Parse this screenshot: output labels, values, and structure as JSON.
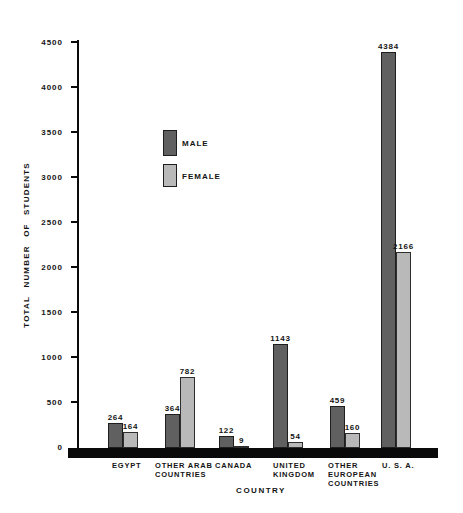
{
  "chart_data": {
    "type": "bar",
    "title": "",
    "categories": [
      "EGYPT",
      "OTHER ARAB\nCOUNTRIES",
      "CANADA",
      "UNITED\nKINGDOM",
      "OTHER\nEUROPEAN\nCOUNTRIES",
      "U. S. A."
    ],
    "series": [
      {
        "name": "MALE",
        "color": "#606060",
        "border_color": "#1e1e1e",
        "values": [
          264,
          364,
          122,
          1143,
          459,
          4384
        ]
      },
      {
        "name": "FEMALE",
        "color": "#b9b9b9",
        "border_color": "#2e2e2e",
        "values": [
          164,
          782,
          9,
          54,
          160,
          2166
        ]
      }
    ],
    "value_labels": {
      "MALE": [
        "264",
        "364",
        "122",
        "1143",
        "459",
        "4384"
      ],
      "FEMALE": [
        "164",
        "782",
        "9",
        "54",
        "160",
        "2166"
      ]
    },
    "xlabel": "COUNTRY",
    "ylabel": "TOTAL NUMBER OF STUDENTS",
    "ylim": [
      0,
      4500
    ],
    "ytick_step": 500,
    "yticks": [
      "0",
      "500",
      "1000",
      "1500",
      "2000",
      "2500",
      "3000",
      "3500",
      "4000",
      "4500"
    ],
    "grid": false,
    "legend": {
      "position": "inside-upper-left",
      "entries": [
        "MALE",
        "FEMALE"
      ]
    },
    "colors": {
      "axis": "#0a0a0a",
      "text": "#141414",
      "background": "#ffffff"
    }
  }
}
